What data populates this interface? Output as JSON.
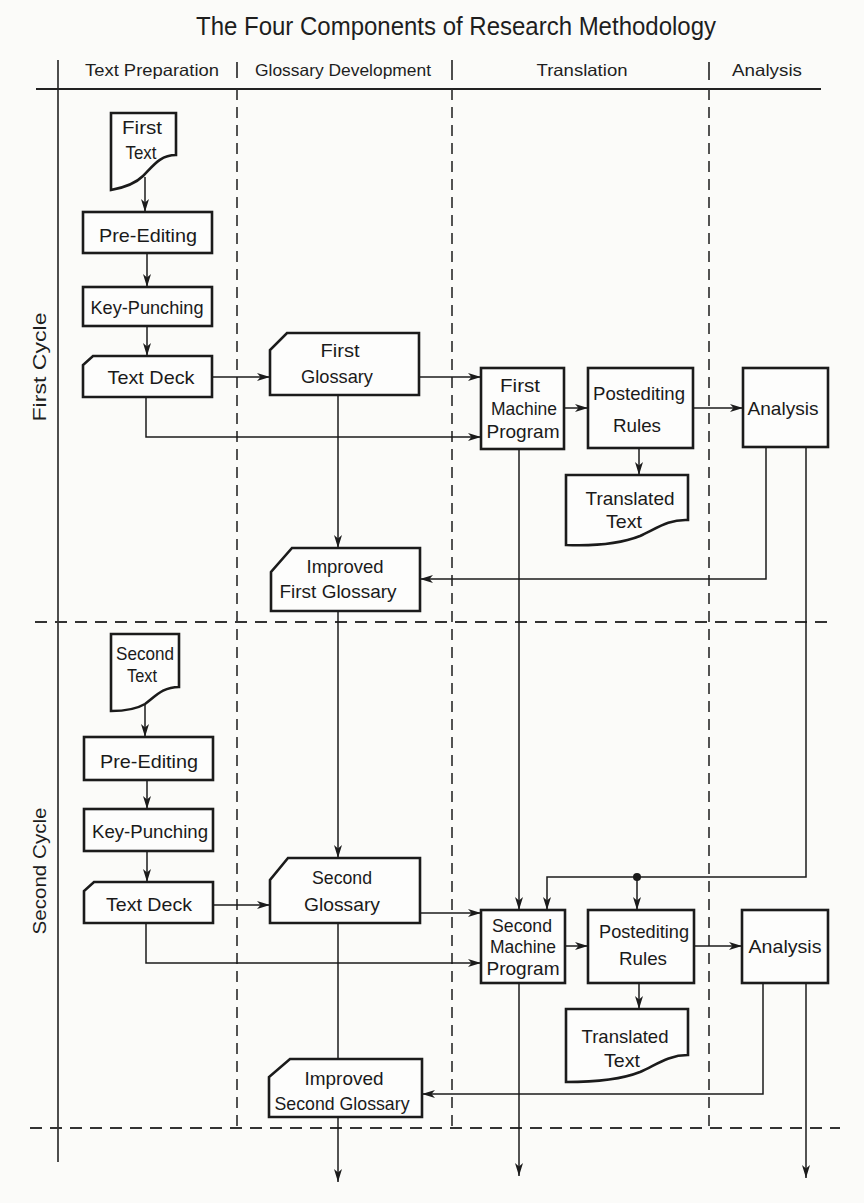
{
  "title": "The Four Components of Research Methodology",
  "colors": {
    "ink": "#1b1b1b",
    "paper": "#fbfbf9"
  },
  "lanes": [
    {
      "label": "Text Preparation"
    },
    {
      "label": "Glossary Development"
    },
    {
      "label": "Translation"
    },
    {
      "label": "Analysis"
    }
  ],
  "cycles": [
    {
      "label": "First Cycle"
    },
    {
      "label": "Second Cycle"
    }
  ],
  "nodes": {
    "first_text": {
      "shape": "document",
      "lane": "Text Preparation",
      "lines": [
        "First",
        "Text"
      ]
    },
    "pre_editing_1": {
      "shape": "process",
      "lane": "Text Preparation",
      "lines": [
        "Pre-Editing"
      ]
    },
    "key_punching_1": {
      "shape": "process",
      "lane": "Text Preparation",
      "lines": [
        "Key-Punching"
      ]
    },
    "text_deck_1": {
      "shape": "punched-card",
      "lane": "Text Preparation",
      "lines": [
        "Text Deck"
      ]
    },
    "first_glossary": {
      "shape": "punched-card",
      "lane": "Glossary Development",
      "lines": [
        "First",
        "Glossary"
      ]
    },
    "first_machine_program": {
      "shape": "process",
      "lane": "Translation",
      "lines": [
        "First",
        "Machine",
        "Program"
      ]
    },
    "postediting_rules_1": {
      "shape": "process",
      "lane": "Translation",
      "lines": [
        "Postediting",
        "Rules"
      ]
    },
    "translated_text_1": {
      "shape": "document",
      "lane": "Translation",
      "lines": [
        "Translated",
        "Text"
      ]
    },
    "analysis_1": {
      "shape": "process",
      "lane": "Analysis",
      "lines": [
        "Analysis"
      ]
    },
    "improved_first_glossary": {
      "shape": "punched-card",
      "lane": "Glossary Development",
      "lines": [
        "Improved",
        "First Glossary"
      ]
    },
    "second_text": {
      "shape": "document",
      "lane": "Text Preparation",
      "lines": [
        "Second",
        "Text"
      ]
    },
    "pre_editing_2": {
      "shape": "process",
      "lane": "Text Preparation",
      "lines": [
        "Pre-Editing"
      ]
    },
    "key_punching_2": {
      "shape": "process",
      "lane": "Text Preparation",
      "lines": [
        "Key-Punching"
      ]
    },
    "text_deck_2": {
      "shape": "punched-card",
      "lane": "Text Preparation",
      "lines": [
        "Text Deck"
      ]
    },
    "second_glossary": {
      "shape": "punched-card",
      "lane": "Glossary Development",
      "lines": [
        "Second",
        "Glossary"
      ]
    },
    "second_machine_program": {
      "shape": "process",
      "lane": "Translation",
      "lines": [
        "Second",
        "Machine",
        "Program"
      ]
    },
    "postediting_rules_2": {
      "shape": "process",
      "lane": "Translation",
      "lines": [
        "Postediting",
        "Rules"
      ]
    },
    "translated_text_2": {
      "shape": "document",
      "lane": "Translation",
      "lines": [
        "Translated",
        "Text"
      ]
    },
    "analysis_2": {
      "shape": "process",
      "lane": "Analysis",
      "lines": [
        "Analysis"
      ]
    },
    "improved_second_glossary": {
      "shape": "punched-card",
      "lane": "Glossary Development",
      "lines": [
        "Improved",
        "Second Glossary"
      ]
    }
  },
  "edges": [
    {
      "from": "first_text",
      "to": "pre_editing_1"
    },
    {
      "from": "pre_editing_1",
      "to": "key_punching_1"
    },
    {
      "from": "key_punching_1",
      "to": "text_deck_1"
    },
    {
      "from": "text_deck_1",
      "to": "first_glossary"
    },
    {
      "from": "text_deck_1",
      "to": "first_machine_program"
    },
    {
      "from": "first_glossary",
      "to": "first_machine_program"
    },
    {
      "from": "first_glossary",
      "to": "improved_first_glossary"
    },
    {
      "from": "first_machine_program",
      "to": "postediting_rules_1"
    },
    {
      "from": "postediting_rules_1",
      "to": "analysis_1"
    },
    {
      "from": "postediting_rules_1",
      "to": "translated_text_1"
    },
    {
      "from": "analysis_1",
      "to": "improved_first_glossary"
    },
    {
      "from": "analysis_1",
      "to": "second_machine_program"
    },
    {
      "from": "analysis_1",
      "to": "postediting_rules_2"
    },
    {
      "from": "first_machine_program",
      "to": "second_machine_program"
    },
    {
      "from": "improved_first_glossary",
      "to": "second_glossary"
    },
    {
      "from": "second_text",
      "to": "pre_editing_2"
    },
    {
      "from": "pre_editing_2",
      "to": "key_punching_2"
    },
    {
      "from": "key_punching_2",
      "to": "text_deck_2"
    },
    {
      "from": "text_deck_2",
      "to": "second_glossary"
    },
    {
      "from": "text_deck_2",
      "to": "second_machine_program"
    },
    {
      "from": "second_glossary",
      "to": "second_machine_program"
    },
    {
      "from": "second_glossary",
      "to": "improved_second_glossary"
    },
    {
      "from": "second_machine_program",
      "to": "postediting_rules_2"
    },
    {
      "from": "postediting_rules_2",
      "to": "analysis_2"
    },
    {
      "from": "postediting_rules_2",
      "to": "translated_text_2"
    },
    {
      "from": "analysis_2",
      "to": "improved_second_glossary"
    },
    {
      "from": "improved_second_glossary",
      "to": "continues-below"
    },
    {
      "from": "second_machine_program",
      "to": "continues-below"
    },
    {
      "from": "analysis_2",
      "to": "continues-below"
    }
  ]
}
